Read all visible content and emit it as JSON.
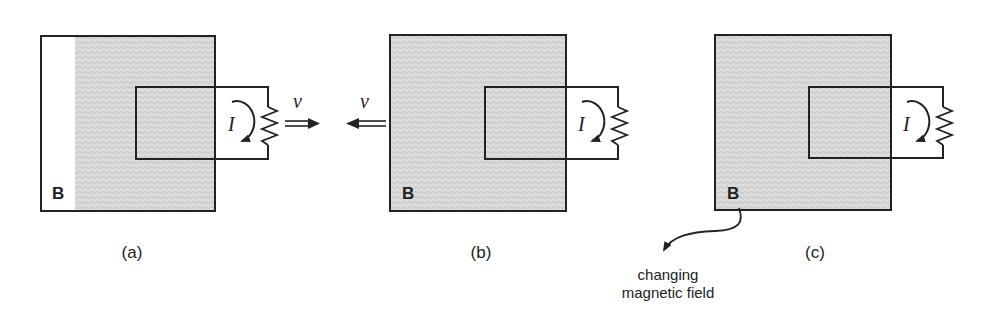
{
  "figure": {
    "colors": {
      "line": "#222222",
      "shade": "#cfcfcf",
      "background": "#ffffff"
    },
    "panels": [
      {
        "id": "a",
        "caption": "(a)",
        "field_label": "B",
        "current_label": "I",
        "velocity_label": "v",
        "velocity_direction": "right",
        "field_region": "partial"
      },
      {
        "id": "b",
        "caption": "(b)",
        "field_label": "B",
        "current_label": "I",
        "velocity_label": "v",
        "velocity_direction": "left",
        "field_region": "full"
      },
      {
        "id": "c",
        "caption": "(c)",
        "field_label": "B",
        "current_label": "I",
        "field_region": "full"
      }
    ],
    "annotation": {
      "line1": "changing",
      "line2": "magnetic field"
    }
  }
}
